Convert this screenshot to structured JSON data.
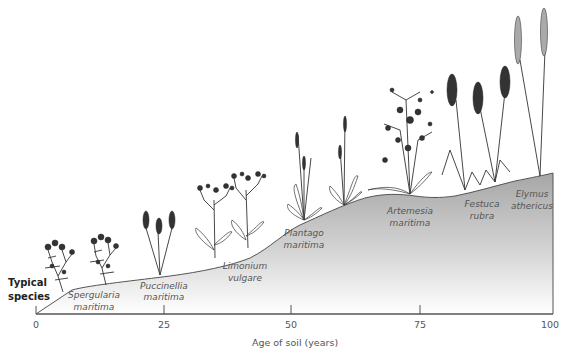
{
  "diagram": {
    "side_label_line1": "Typical",
    "side_label_line2": "species",
    "x_axis": {
      "title": "Age of soil (years)",
      "min": 0,
      "max": 100,
      "ticks": [
        {
          "value": 0,
          "label": "0"
        },
        {
          "value": 25,
          "label": "25"
        },
        {
          "value": 50,
          "label": "50"
        },
        {
          "value": 75,
          "label": "75"
        },
        {
          "value": 100,
          "label": "100"
        }
      ]
    },
    "species": [
      {
        "genus": "Spergularia",
        "epithet": "maritima",
        "age": 10
      },
      {
        "genus": "Puccinellia",
        "epithet": "maritima",
        "age": 24
      },
      {
        "genus": "Limonium",
        "epithet": "vulgare",
        "age": 40
      },
      {
        "genus": "Plantago",
        "epithet": "maritima",
        "age": 55
      },
      {
        "genus": "Artemesia",
        "epithet": "maritima",
        "age": 72
      },
      {
        "genus": "Festuca",
        "epithet": "rubra",
        "age": 88
      },
      {
        "genus": "Elymus",
        "epithet": "athericus",
        "age": 97
      }
    ],
    "colors": {
      "soil_dark": "#a6a6a6",
      "soil_light": "#ffffff",
      "outline": "#555555",
      "plant": "#333333"
    }
  }
}
